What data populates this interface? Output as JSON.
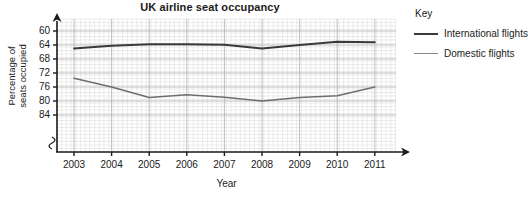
{
  "chart_data": {
    "type": "line",
    "title": "UK airline seat occupancy",
    "xlabel": "Year",
    "ylabel": "Percentage of\nseats occupied",
    "categories": [
      "2003",
      "2004",
      "2005",
      "2006",
      "2007",
      "2008",
      "2009",
      "2010",
      "2011"
    ],
    "x": [
      2003,
      2004,
      2005,
      2006,
      2007,
      2008,
      2009,
      2010,
      2011
    ],
    "xlim": [
      2002.4,
      2011.6
    ],
    "ylim": [
      58,
      86
    ],
    "yticks": [
      60,
      64,
      68,
      72,
      76,
      80,
      84
    ],
    "axis_break": true,
    "grid": true,
    "grid_minor": true,
    "legend_position": "right",
    "legend_title": "Key",
    "series": [
      {
        "name": "International flights",
        "color": "#3a3a3a",
        "values": [
          79.0,
          79.8,
          80.2,
          80.2,
          80.1,
          79.0,
          80.0,
          80.9,
          80.8
        ]
      },
      {
        "name": "Domestic flights",
        "color": "#6e6e6e",
        "values": [
          70.5,
          68.0,
          65.0,
          65.8,
          65.1,
          64.0,
          65.0,
          65.5,
          68.0
        ]
      }
    ]
  },
  "axis": {
    "y_tick_labels": [
      "84",
      "80",
      "76",
      "72",
      "68",
      "64",
      "60"
    ],
    "x_tick_labels": [
      "2003",
      "2004",
      "2005",
      "2006",
      "2007",
      "2008",
      "2009",
      "2010",
      "2011"
    ],
    "x_axis_title": "Year",
    "y_axis_title": "Percentage of\nseats occupied"
  },
  "legend": {
    "title": "Key",
    "items": [
      {
        "label": "International flights",
        "color": "#3a3a3a"
      },
      {
        "label": "Domestic flights",
        "color": "#6e6e6e"
      }
    ]
  }
}
